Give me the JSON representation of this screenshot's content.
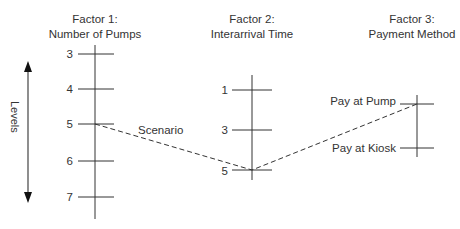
{
  "diagram": {
    "levels_label": "Levels",
    "scenario_label": "Scenario",
    "factors": [
      {
        "title_line1": "Factor 1:",
        "title_line2": "Number of Pumps",
        "levels": [
          "3",
          "4",
          "5",
          "6",
          "7"
        ],
        "selected": "5"
      },
      {
        "title_line1": "Factor 2:",
        "title_line2": "Interarrival Time",
        "levels": [
          "1",
          "3",
          "5"
        ],
        "selected": "5"
      },
      {
        "title_line1": "Factor 3:",
        "title_line2": "Payment Method",
        "levels": [
          "Pay at Pump",
          "Pay at Kiosk"
        ],
        "selected": "Pay at Pump"
      }
    ],
    "colors": {
      "line": "#333333",
      "background": "#ffffff"
    }
  }
}
